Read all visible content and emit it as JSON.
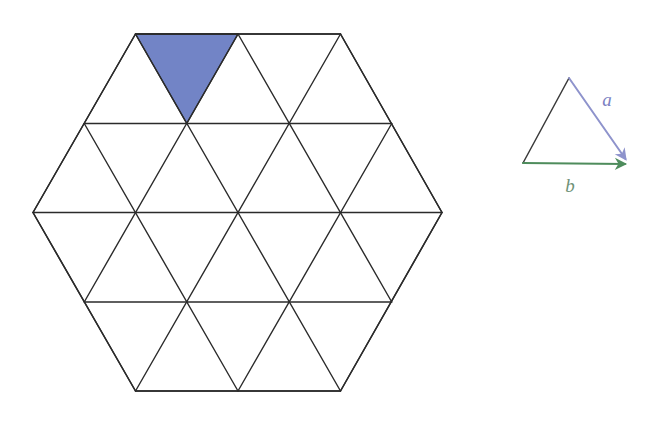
{
  "figure": {
    "background_color": "#ffffff",
    "line_color": "#2b2b2b",
    "line_width": 1.4
  },
  "hexagon": {
    "name": "triangular-grid-hexagon",
    "description": "Regular hexagon subdivided into 24 equilateral unit triangles",
    "center": {
      "x": 237.5,
      "y": 212.5
    },
    "circumradius": 205,
    "orientation": "pointy-left-right",
    "rows": 4,
    "unit_triangles": 24,
    "vertices": [
      {
        "x": 33,
        "y": 212.5
      },
      {
        "x": 135.5,
        "y": 34
      },
      {
        "x": 340.5,
        "y": 34
      },
      {
        "x": 442,
        "y": 212.5
      },
      {
        "x": 340.5,
        "y": 391
      },
      {
        "x": 135.5,
        "y": 391
      }
    ],
    "row_y": [
      34,
      123.5,
      212.5,
      302,
      391
    ],
    "stroke": "#2b2b2b",
    "stroke_width": 1.4,
    "fill": "#ffffff"
  },
  "shaded_triangle": {
    "name": "highlighted-unit-cell",
    "label": "",
    "fill_color": "#7284c6",
    "stroke_color": "#2b2b2b",
    "orientation": "downward",
    "row": 1,
    "index_in_row": 1,
    "vertices": [
      {
        "x": 135.5,
        "y": 34
      },
      {
        "x": 238.0,
        "y": 34
      },
      {
        "x": 186.75,
        "y": 123.5
      }
    ]
  },
  "vector_diagram": {
    "name": "basis-vector-triangle",
    "apex": {
      "x": 569,
      "y": 78
    },
    "origin": {
      "x": 523,
      "y": 163
    },
    "terminus": {
      "x": 629,
      "y": 164
    },
    "edge_color": "#3a3a3a",
    "edge_width": 1.4,
    "vectors": [
      {
        "id": "a",
        "label": "a",
        "color": "#8e93cc",
        "label_color": "#7b81c2",
        "from": {
          "x": 569,
          "y": 78
        },
        "to": {
          "x": 629,
          "y": 164
        },
        "label_pos": {
          "x": 607,
          "y": 105
        },
        "stroke_width": 2.0,
        "arrowhead": "filled-v"
      },
      {
        "id": "b",
        "label": "b",
        "color": "#4e8c5c",
        "label_color": "#6f9277",
        "from": {
          "x": 523,
          "y": 163
        },
        "to": {
          "x": 629,
          "y": 164
        },
        "label_pos": {
          "x": 570,
          "y": 190
        },
        "stroke_width": 2.0,
        "arrowhead": "filled-v"
      }
    ]
  }
}
